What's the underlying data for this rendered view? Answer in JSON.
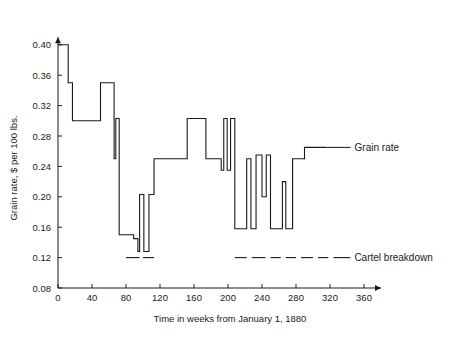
{
  "chart_data": {
    "type": "line",
    "title": "",
    "xlabel": "Time in weeks from January 1, 1880",
    "ylabel": "Grain rate, $ per 100 lbs.",
    "xlim": [
      0,
      380
    ],
    "ylim": [
      0.08,
      0.41
    ],
    "grid": false,
    "legend_position": "right-inline-annotations",
    "xticks": [
      0,
      40,
      80,
      120,
      160,
      200,
      240,
      280,
      320,
      360
    ],
    "xtick_labels": [
      "0",
      "40",
      "80",
      "120",
      "160",
      "200",
      "240",
      "280",
      "320",
      "360"
    ],
    "yticks": [
      0.08,
      0.12,
      0.16,
      0.2,
      0.24,
      0.28,
      0.32,
      0.36,
      0.4
    ],
    "ytick_labels": [
      "0.08",
      "0.12",
      "0.16",
      "0.20",
      "0.24",
      "0.28",
      "0.32",
      "0.36",
      "0.40"
    ],
    "series": [
      {
        "name": "Grain rate",
        "style": "step-post",
        "color": "#1a1a1a",
        "points": [
          [
            0,
            0.4
          ],
          [
            12,
            0.4
          ],
          [
            12,
            0.35
          ],
          [
            17,
            0.35
          ],
          [
            17,
            0.3
          ],
          [
            40,
            0.3
          ],
          [
            40,
            0.3
          ],
          [
            50,
            0.3
          ],
          [
            50,
            0.35
          ],
          [
            66,
            0.35
          ],
          [
            66,
            0.25
          ],
          [
            68,
            0.25
          ],
          [
            68,
            0.303
          ],
          [
            72,
            0.303
          ],
          [
            72,
            0.15
          ],
          [
            89,
            0.15
          ],
          [
            89,
            0.145
          ],
          [
            94,
            0.145
          ],
          [
            94,
            0.128
          ],
          [
            96,
            0.128
          ],
          [
            96,
            0.203
          ],
          [
            101,
            0.203
          ],
          [
            101,
            0.128
          ],
          [
            107,
            0.128
          ],
          [
            107,
            0.203
          ],
          [
            113,
            0.203
          ],
          [
            113,
            0.25
          ],
          [
            132,
            0.25
          ],
          [
            132,
            0.25
          ],
          [
            140,
            0.25
          ],
          [
            140,
            0.25
          ],
          [
            152,
            0.25
          ],
          [
            152,
            0.303
          ],
          [
            174,
            0.303
          ],
          [
            174,
            0.25
          ],
          [
            192,
            0.25
          ],
          [
            192,
            0.235
          ],
          [
            195,
            0.235
          ],
          [
            195,
            0.303
          ],
          [
            199,
            0.303
          ],
          [
            199,
            0.235
          ],
          [
            203,
            0.235
          ],
          [
            203,
            0.303
          ],
          [
            208,
            0.303
          ],
          [
            208,
            0.158
          ],
          [
            222,
            0.158
          ],
          [
            222,
            0.25
          ],
          [
            227,
            0.25
          ],
          [
            227,
            0.158
          ],
          [
            233,
            0.158
          ],
          [
            233,
            0.255
          ],
          [
            240,
            0.255
          ],
          [
            240,
            0.2
          ],
          [
            245,
            0.2
          ],
          [
            245,
            0.255
          ],
          [
            250,
            0.255
          ],
          [
            250,
            0.158
          ],
          [
            264,
            0.158
          ],
          [
            264,
            0.22
          ],
          [
            268,
            0.22
          ],
          [
            268,
            0.158
          ],
          [
            276,
            0.158
          ],
          [
            276,
            0.25
          ],
          [
            290,
            0.25
          ],
          [
            290,
            0.265
          ],
          [
            316,
            0.265
          ]
        ]
      }
    ],
    "annotations": [
      {
        "name": "grain-rate-annotation",
        "label": "Grain rate",
        "anchor_x": 316,
        "anchor_y": 0.265
      },
      {
        "name": "cartel-breakdown-annotation",
        "label": "Cartel breakdown",
        "level": 0.12,
        "segments": [
          [
            80,
            96
          ],
          [
            100,
            113
          ],
          [
            208,
            222
          ],
          [
            228,
            244
          ],
          [
            250,
            262
          ],
          [
            268,
            280
          ],
          [
            286,
            300
          ],
          [
            306,
            318
          ],
          [
            324,
            344
          ]
        ]
      }
    ]
  },
  "colors": {
    "background": "#ffffff",
    "ink": "#1a1a1a"
  }
}
